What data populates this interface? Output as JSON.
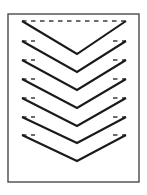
{
  "figure": {
    "type": "line-art-diagram",
    "canvas": {
      "width": 147,
      "height": 195,
      "background": "#ffffff"
    },
    "frame": {
      "name": "rectangular border frame",
      "x": 8,
      "y": 14,
      "width": 131,
      "height": 168,
      "stroke": "#4a4a4a",
      "stroke_width": 1.4,
      "fill": "#ffffff"
    },
    "chevrons": {
      "count": 7,
      "direction": "down",
      "stroke": "#1a1a1a",
      "stroke_width": 2.1,
      "dash_stroke": "#3c3c3c",
      "dash_stroke_width": 1.6,
      "dash_pattern": "4.5 4.5",
      "left_tip_x": 22,
      "right_tip_x": 126,
      "vertex_x": 77,
      "items": [
        {
          "index": 1,
          "tip_y": 21,
          "vertex_y": 54,
          "dash_full": true
        },
        {
          "index": 2,
          "tip_y": 41,
          "vertex_y": 72,
          "dash_full": false
        },
        {
          "index": 3,
          "tip_y": 60,
          "vertex_y": 90,
          "dash_full": false
        },
        {
          "index": 4,
          "tip_y": 79,
          "vertex_y": 108,
          "dash_full": false
        },
        {
          "index": 5,
          "tip_y": 98,
          "vertex_y": 126,
          "dash_full": false
        },
        {
          "index": 6,
          "tip_y": 117,
          "vertex_y": 143,
          "dash_full": false
        },
        {
          "index": 7,
          "tip_y": 135,
          "vertex_y": 161,
          "dash_full": false
        }
      ],
      "partial_dash_length": 13
    }
  }
}
